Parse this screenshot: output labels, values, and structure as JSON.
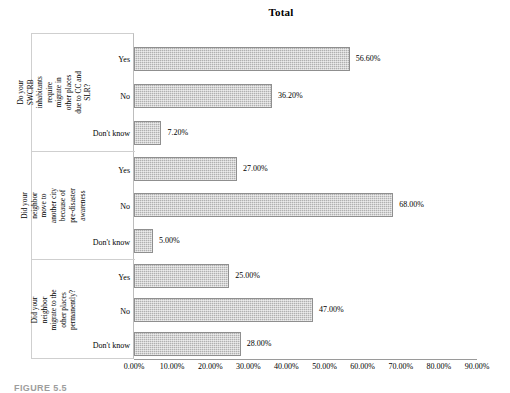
{
  "chart_data": {
    "type": "bar",
    "orientation": "horizontal",
    "title": "Total",
    "xlabel": "",
    "ylabel": "",
    "xlim": [
      0,
      90
    ],
    "xticks": [
      "0.00%",
      "10.00%",
      "20.00%",
      "30.00%",
      "40.00%",
      "50.00%",
      "60.00%",
      "70.00%",
      "80.00%",
      "90.00%"
    ],
    "xtick_values": [
      0,
      10,
      20,
      30,
      40,
      50,
      60,
      70,
      80,
      90
    ],
    "grid": false,
    "legend": "none",
    "bar_color": "#b0b0b0",
    "bar_border_color": "#8f8f8f",
    "groups": [
      {
        "label": "Do your SWCRB inhabitants require migrate in other places due to CC and SLR?",
        "categories": [
          "Yes",
          "No",
          "Don't know"
        ],
        "values": [
          56.6,
          36.2,
          7.2
        ],
        "value_labels": [
          "56.60%",
          "36.20%",
          "7.20%"
        ]
      },
      {
        "label": "Did your neighbor move to another city because of pre-disaster awareness",
        "categories": [
          "Yes",
          "No",
          "Don't know"
        ],
        "values": [
          27.0,
          68.0,
          5.0
        ],
        "value_labels": [
          "27.00%",
          "68.00%",
          "5.00%"
        ]
      },
      {
        "label": "Did your neighbor migrate to the other places permanently?",
        "categories": [
          "Yes",
          "No",
          "Don't know"
        ],
        "values": [
          25.0,
          47.0,
          28.0
        ],
        "value_labels": [
          "25.00%",
          "47.00%",
          "28.00%"
        ]
      }
    ]
  },
  "caption": "FIGURE 5.5"
}
